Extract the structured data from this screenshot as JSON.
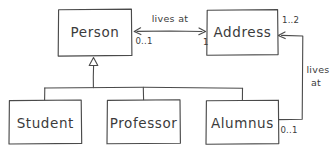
{
  "diagram": {
    "kind": "uml-class-diagram",
    "style": "hand-drawn-sketch",
    "stroke_color": "#4a4a4a",
    "text_color": "#3b3b3b",
    "background_color": "#ffffff",
    "classes": [
      {
        "id": "person",
        "name": "Person"
      },
      {
        "id": "address",
        "name": "Address"
      },
      {
        "id": "student",
        "name": "Student"
      },
      {
        "id": "professor",
        "name": "Professor"
      },
      {
        "id": "alumnus",
        "name": "Alumnus"
      }
    ],
    "associations": [
      {
        "id": "person-lives-at-address",
        "label": "lives at",
        "from": "Person",
        "to": "Address",
        "source_multiplicity": "0..1",
        "target_multiplicity": "1"
      },
      {
        "id": "alumnus-lives-at-address",
        "label_line1": "lives",
        "label_line2": "at",
        "from": "Alumnus",
        "to": "Address",
        "source_multiplicity": "0..1",
        "target_multiplicity": "1..2"
      }
    ],
    "generalizations": [
      {
        "id": "student-to-person",
        "subclass": "Student",
        "superclass": "Person"
      },
      {
        "id": "professor-to-person",
        "subclass": "Professor",
        "superclass": "Person"
      },
      {
        "id": "alumnus-to-person",
        "subclass": "Alumnus",
        "superclass": "Person"
      }
    ]
  }
}
